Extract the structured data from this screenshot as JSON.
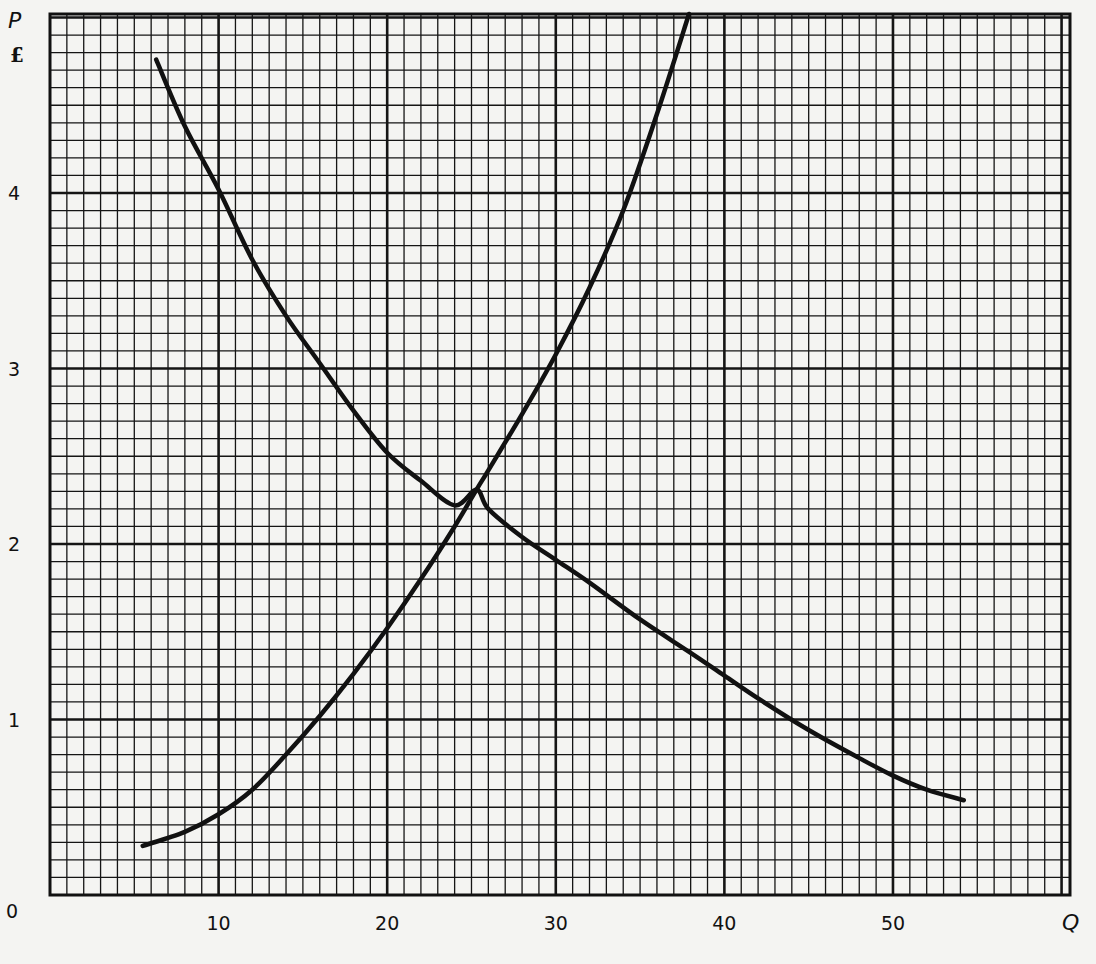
{
  "chart_data": {
    "type": "line",
    "title": "",
    "xlabel": "Q",
    "ylabel": "P",
    "y_unit_label": "£",
    "origin_label": "0",
    "xlim": [
      0,
      60.5
    ],
    "ylim": [
      0,
      5.02
    ],
    "x_major_step": 10,
    "x_minor_step": 1,
    "y_major_step": 1,
    "y_minor_step": 0.1,
    "grid": true,
    "x_ticks": [
      10,
      20,
      30,
      40,
      50
    ],
    "y_ticks": [
      1,
      2,
      3,
      4
    ],
    "series": [
      {
        "name": "Demand",
        "color": "#111111",
        "points": [
          [
            6.3,
            4.76
          ],
          [
            8,
            4.38
          ],
          [
            10,
            4.02
          ],
          [
            12,
            3.62
          ],
          [
            14,
            3.3
          ],
          [
            16,
            3.03
          ],
          [
            18,
            2.76
          ],
          [
            20,
            2.52
          ],
          [
            22,
            2.36
          ],
          [
            24,
            2.22
          ],
          [
            25.3,
            2.31
          ],
          [
            26,
            2.2
          ],
          [
            28,
            2.04
          ],
          [
            30,
            1.91
          ],
          [
            32,
            1.78
          ],
          [
            35,
            1.57
          ],
          [
            38,
            1.38
          ],
          [
            40,
            1.25
          ],
          [
            42,
            1.12
          ],
          [
            45,
            0.94
          ],
          [
            48,
            0.78
          ],
          [
            50,
            0.68
          ],
          [
            52,
            0.6
          ],
          [
            54.2,
            0.54
          ]
        ]
      },
      {
        "name": "Supply",
        "color": "#111111",
        "points": [
          [
            5.5,
            0.28
          ],
          [
            8,
            0.36
          ],
          [
            10,
            0.46
          ],
          [
            12,
            0.6
          ],
          [
            14,
            0.8
          ],
          [
            16,
            1.02
          ],
          [
            18,
            1.26
          ],
          [
            20,
            1.52
          ],
          [
            22,
            1.8
          ],
          [
            24,
            2.1
          ],
          [
            25.3,
            2.31
          ],
          [
            26,
            2.42
          ],
          [
            28,
            2.74
          ],
          [
            30,
            3.08
          ],
          [
            32,
            3.46
          ],
          [
            34,
            3.9
          ],
          [
            36,
            4.45
          ],
          [
            37.9,
            5.02
          ]
        ]
      }
    ],
    "annotations": [
      {
        "label": "equilibrium (intersection)",
        "q": 25.3,
        "p": 2.31
      }
    ]
  },
  "labels": {
    "y_axis": "P",
    "y_unit": "£",
    "x_axis": "Q",
    "origin": "0",
    "x_ticks": [
      "10",
      "20",
      "30",
      "40",
      "50"
    ],
    "y_ticks": [
      "1",
      "2",
      "3",
      "4"
    ]
  }
}
